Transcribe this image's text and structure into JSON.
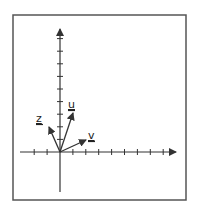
{
  "diagram": {
    "type": "vector-plot",
    "frame": {
      "x": 13,
      "y": 15,
      "width": 173,
      "height": 185,
      "stroke": "#555555"
    },
    "origin_px": {
      "x": 60,
      "y": 152
    },
    "tick_spacing_px": {
      "x": 12.9,
      "y": 12.6
    },
    "axes": {
      "x": {
        "start_px": 20,
        "end_px": 176,
        "ticks_left": 2,
        "ticks_right": 8,
        "arrow": true
      },
      "y": {
        "start_px": 192,
        "end_px": 29,
        "ticks_below": 0,
        "ticks_above": 9,
        "arrow": true
      }
    },
    "axis_color": "#333333",
    "vectors": [
      {
        "name": "u",
        "label": "u",
        "tip_px": {
          "x": 73,
          "y": 113
        },
        "label_px": {
          "x": 68,
          "y": 108
        },
        "approx_components": [
          1,
          3
        ]
      },
      {
        "name": "v",
        "label": "v",
        "tip_px": {
          "x": 86,
          "y": 140
        },
        "label_px": {
          "x": 88,
          "y": 139
        },
        "approx_components": [
          2,
          1
        ]
      },
      {
        "name": "z",
        "label": "z",
        "tip_px": {
          "x": 49,
          "y": 127
        },
        "label_px": {
          "x": 36,
          "y": 122
        },
        "approx_components": [
          -1,
          2
        ]
      }
    ]
  }
}
